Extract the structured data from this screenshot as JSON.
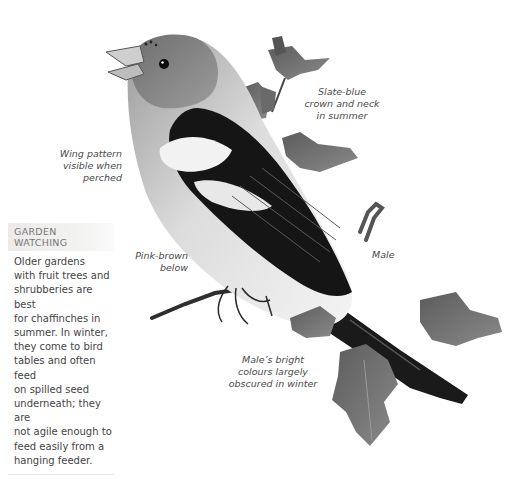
{
  "illustration": {
    "icon": "chaffinch-bird-illustration",
    "colors": {
      "ink": "#1a1a1a",
      "grey_mid": "#7a7a7a",
      "grey_light": "#c8c8c8",
      "paper": "#ffffff"
    }
  },
  "captions": {
    "crown": "Slate-blue\ncrown and neck\nin summer",
    "wing": "Wing pattern\nvisible when\nperched",
    "belly": "Pink-brown\nbelow",
    "sex": "Male",
    "winter": "Male’s bright\ncolours largely\nobscured in winter"
  },
  "sidebar": {
    "title": "GARDEN\nWATCHING",
    "body": "Older gardens\nwith fruit trees and\nshrubberies are best\nfor chaffinches in\nsummer. In winter,\nthey come to bird\ntables and often feed\non spilled seed\nunderneath; they are\nnot agile enough to\nfeed easily from a\nhanging feeder."
  }
}
